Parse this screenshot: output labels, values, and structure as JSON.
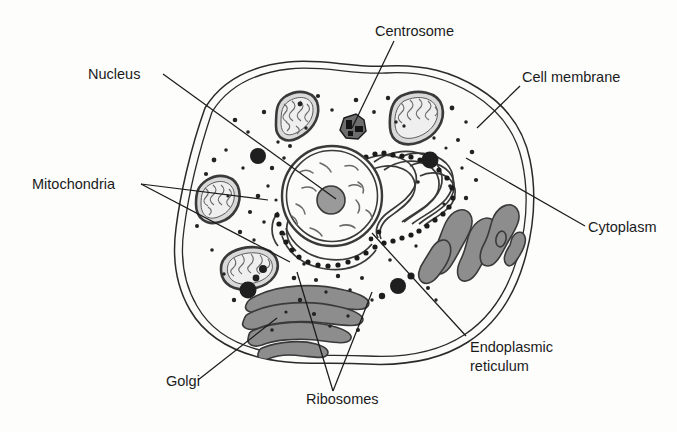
{
  "diagram": {
    "type": "labelled biological diagram",
    "background_color": "#fdfdfc",
    "line_color": "#1b1b1b",
    "organelle_fill": "#8d8d8d",
    "cytosol_fill": "#fbfbfa"
  },
  "labels": {
    "nucleus": "Nucleus",
    "mitochondria": "Mitochondria",
    "golgi": "Golgi",
    "ribosomes": "Ribosomes",
    "centrosome": "Centrosome",
    "cell_membrane": "Cell membrane",
    "cytoplasm": "Cytoplasm",
    "er_line1": "Endoplasmic",
    "er_line2": "reticulum"
  },
  "structures": {
    "cell_membrane": "double outline enclosing whole cell",
    "nucleus": "central sphere with double envelope, nucleolus and chromatin",
    "nucleolus": "dark gray disc inside nucleus",
    "mitochondria_count": 3,
    "rough_er": "folded membranes studded with ribosomes, right of nucleus",
    "smooth_er": "gray tubules, lower right",
    "golgi": "stacked curved gray sacs, lower left",
    "centrosome": "small dark irregular body above nucleus",
    "vesicles": "scattered dark round bodies",
    "free_ribosomes": "small black dots throughout cytoplasm"
  }
}
